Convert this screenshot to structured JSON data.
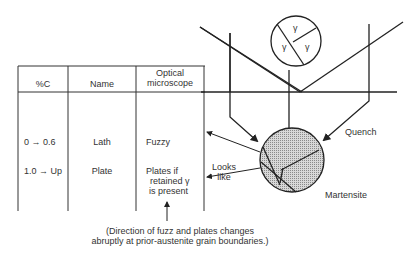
{
  "table": {
    "headers": [
      "%C",
      "Name",
      "Optical",
      "microscope"
    ],
    "rows": [
      {
        "carbon": "0 → 0.6",
        "name": "Lath",
        "optical": [
          "Fuzzy"
        ]
      },
      {
        "carbon": "1.0 → Up",
        "name": "Plate",
        "optical": [
          "Plates if",
          "retained γ",
          "is present"
        ]
      }
    ]
  },
  "austenite": {
    "grain_label": "γ"
  },
  "labels": {
    "quench": "Quench",
    "martensite": "Martensite",
    "looks_like_1": "Looks",
    "looks_like_2": "like",
    "note_line1": "(Direction of fuzz and plates changes",
    "note_line2": "abruptly at prior-austenite grain boundaries.)"
  },
  "colors": {
    "line": "#222222",
    "martensite_fill": "#b8b8b8"
  }
}
